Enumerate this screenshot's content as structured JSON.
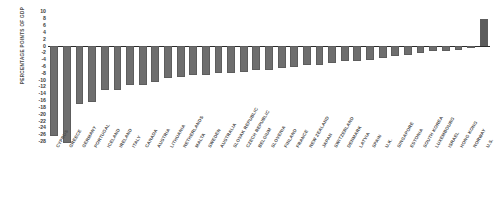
{
  "chart_data": {
    "type": "bar",
    "title": "",
    "xlabel": "",
    "ylabel": "PERCENTAGE POINTS OF GDP",
    "ylim": [
      -29,
      10
    ],
    "ytick_labels": [
      "10",
      "8",
      "6",
      "4",
      "2",
      "0",
      "-2",
      "-4",
      "-6",
      "-8",
      "-10",
      "-12",
      "-14",
      "-16",
      "-18",
      "-20",
      "-22",
      "-24",
      "-26",
      "-28"
    ],
    "ytick_values": [
      10,
      8,
      6,
      4,
      2,
      0,
      -2,
      -4,
      -6,
      -8,
      -10,
      -12,
      -14,
      -16,
      -18,
      -20,
      -22,
      -24,
      -26,
      -28
    ],
    "grid": false,
    "legend": "none",
    "bar_color": "#6e6e6e",
    "axis_color": "#2b2b2b",
    "categories": [
      "CYPRUS",
      "GREECE",
      "GERMANY",
      "PORTUGAL",
      "ICELAND",
      "IRELAND",
      "ITALY",
      "CANADA",
      "AUSTRIA",
      "LITHUANIA",
      "NETHERLANDS",
      "MALTA",
      "SWEDEN",
      "AUSTRALIA",
      "SLOVAK REPUBLIC",
      "CZECH REPUBLIC",
      "BELGIUM",
      "SLOVENIA",
      "FINLAND",
      "FRANCE",
      "NEW ZEALAND",
      "JAPAN",
      "SWITZERLAND",
      "DENMARK",
      "LATVIA",
      "SPAIN",
      "U.K.",
      "SINGAPORE",
      "ESTONIA",
      "SOUTH KOREA",
      "LUXEMBOURG",
      "ISRAEL",
      "HONG KONG",
      "NORWAY",
      "U.S."
    ],
    "values": [
      -26.5,
      -28.5,
      -17.0,
      -16.5,
      -13.0,
      -13.0,
      -11.5,
      -11.5,
      -10.5,
      -9.5,
      -9.0,
      -8.5,
      -8.5,
      -8.0,
      -8.0,
      -7.5,
      -7.0,
      -7.0,
      -6.5,
      -6.0,
      -5.5,
      -5.5,
      -5.0,
      -4.5,
      -4.5,
      -4.0,
      -3.5,
      -3.0,
      -2.5,
      -2.0,
      -1.5,
      -1.5,
      -1.0,
      -0.5,
      8.0
    ]
  }
}
